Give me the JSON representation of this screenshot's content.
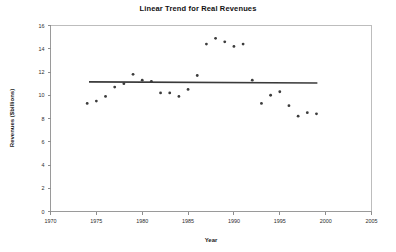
{
  "chart_data": {
    "type": "scatter",
    "title": "Linear Trend for Real Revenues",
    "xlabel": "Year",
    "ylabel": "Revenues ($billions)",
    "xlim": [
      1970,
      2005
    ],
    "ylim": [
      0,
      16
    ],
    "xticks": [
      1970,
      1975,
      1980,
      1985,
      1990,
      1995,
      2000,
      2005
    ],
    "yticks": [
      0,
      2,
      4,
      6,
      8,
      10,
      12,
      14,
      16
    ],
    "grid": false,
    "legend": null,
    "x": [
      1974,
      1975,
      1976,
      1977,
      1978,
      1979,
      1980,
      1981,
      1982,
      1983,
      1984,
      1985,
      1986,
      1987,
      1988,
      1989,
      1990,
      1991,
      1992,
      1993,
      1994,
      1995,
      1996,
      1997,
      1998,
      1999
    ],
    "values": [
      9.3,
      9.5,
      9.9,
      10.7,
      11.0,
      11.8,
      11.3,
      11.2,
      10.2,
      10.2,
      9.9,
      10.5,
      11.7,
      14.4,
      14.9,
      14.6,
      14.2,
      14.4,
      11.3,
      9.3,
      10.0,
      10.3,
      9.1,
      8.2,
      8.5,
      8.4
    ],
    "series": [
      {
        "name": "Real Revenues",
        "type": "scatter",
        "values": [
          9.3,
          9.5,
          9.9,
          10.7,
          11.0,
          11.8,
          11.3,
          11.2,
          10.2,
          10.2,
          9.9,
          10.5,
          11.7,
          14.4,
          14.9,
          14.6,
          14.2,
          14.4,
          11.3,
          9.3,
          10.0,
          10.3,
          9.1,
          8.2,
          8.5,
          8.4
        ]
      },
      {
        "name": "Linear Trend",
        "type": "line",
        "x": [
          1974.2,
          1999.1
        ],
        "values": [
          11.15,
          11.05
        ]
      }
    ],
    "trend_line": {
      "x_start": 1974.2,
      "x_end": 1999.1,
      "y_start": 11.15,
      "y_end": 11.05
    }
  },
  "colors": {
    "point": "#3c3c3c",
    "trend": "#3a3a3a",
    "axis": "#9a9a9a",
    "frame": "#bdbdbd",
    "background": "#ffffff",
    "text": "#1a1a1a"
  }
}
